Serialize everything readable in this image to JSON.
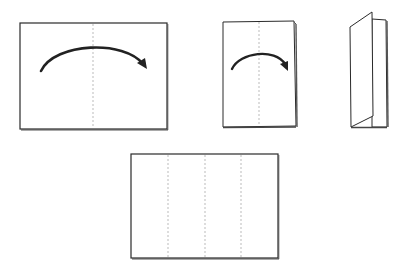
{
  "diagram": {
    "title": "",
    "colors": {
      "stroke": "#2a2a2a",
      "shadow": "#555555",
      "fold_line": "#aaaaaa",
      "paper": "#ffffff",
      "arrow": "#222222"
    },
    "steps": [
      {
        "id": "step-1",
        "label": "",
        "shape": "sheet",
        "fold_lines": 1,
        "arrow": "fold-right"
      },
      {
        "id": "step-2",
        "label": "",
        "shape": "half-sheet",
        "fold_lines": 1,
        "arrow": "fold-right"
      },
      {
        "id": "step-3",
        "label": "",
        "shape": "folded-booklet",
        "fold_lines": 0,
        "arrow": "none"
      },
      {
        "id": "step-4",
        "label": "",
        "shape": "unfolded-sheet",
        "fold_lines": 3,
        "arrow": "none"
      }
    ]
  }
}
